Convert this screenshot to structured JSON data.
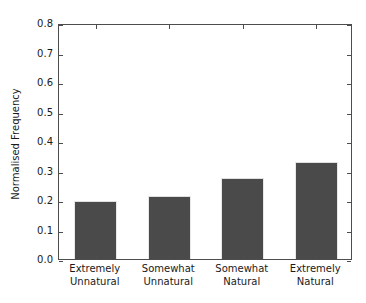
{
  "chart_data": {
    "type": "bar",
    "title": "",
    "xlabel": "",
    "ylabel": "Normalised Frequency",
    "categories": [
      "Extremely Unnatural",
      "Somewhat Unnatural",
      "Somewhat Natural",
      "Extremely Natural"
    ],
    "category_lines": [
      [
        "Extremely",
        "Unnatural"
      ],
      [
        "Somewhat",
        "Unnatural"
      ],
      [
        "Somewhat",
        "Natural"
      ],
      [
        "Extremely",
        "Natural"
      ]
    ],
    "values": [
      0.195,
      0.215,
      0.275,
      0.33
    ],
    "ylim": [
      0.0,
      0.8
    ],
    "yticks": [
      "0.0",
      "0.1",
      "0.2",
      "0.3",
      "0.4",
      "0.5",
      "0.6",
      "0.7",
      "0.8"
    ],
    "ytick_values": [
      0.0,
      0.1,
      0.2,
      0.3,
      0.4,
      0.5,
      0.6,
      0.7,
      0.8
    ],
    "grid": false,
    "legend": null,
    "bar_color": "#4a4a4a",
    "bar_edge_color": "#e8e8e8",
    "axis_color": "#4d4d4d",
    "background_color": "#ffffff",
    "text_color": "#1a1a1a"
  }
}
